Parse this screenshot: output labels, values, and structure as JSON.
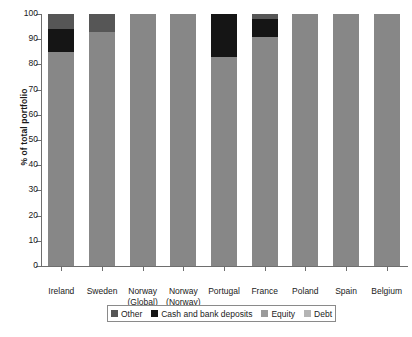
{
  "chart_data": {
    "type": "bar",
    "stacked": true,
    "title": "",
    "xlabel": "",
    "ylabel": "% of total portfolio",
    "ylim": [
      0,
      100
    ],
    "ytick_labels": [
      "0",
      "10",
      "20",
      "30",
      "40",
      "50",
      "60",
      "70",
      "80",
      "90",
      "100"
    ],
    "ytick_values": [
      0,
      10,
      20,
      30,
      40,
      50,
      60,
      70,
      80,
      90,
      100
    ],
    "grid": false,
    "legend_position": "bottom",
    "categories": [
      "Ireland",
      "Sweden",
      "Norway (Global)",
      "Norway (Norway)",
      "Portugal",
      "France",
      "Poland",
      "Spain",
      "Belgium"
    ],
    "category_lines": [
      [
        "Ireland"
      ],
      [
        "Sweden"
      ],
      [
        "Norway",
        "(Global)"
      ],
      [
        "Norway",
        "(Norway)"
      ],
      [
        "Portugal"
      ],
      [
        "France"
      ],
      [
        "Poland"
      ],
      [
        "Spain"
      ],
      [
        "Belgium"
      ]
    ],
    "series": [
      {
        "name": "Other",
        "color": "#565656",
        "values": [
          6,
          7,
          0,
          0,
          0,
          2,
          0,
          0,
          0
        ]
      },
      {
        "name": "Cash and bank deposits",
        "color": "#151515",
        "values": [
          9,
          0,
          0,
          0,
          17,
          7,
          0,
          0,
          0
        ]
      },
      {
        "name": "Equity",
        "color": "#878787",
        "values": [
          85,
          93,
          100,
          100,
          83,
          91,
          100,
          100,
          100
        ]
      },
      {
        "name": "Debt",
        "color": "#a8a8a8",
        "values": [
          0,
          0,
          0,
          0,
          0,
          0,
          0,
          0,
          0
        ]
      }
    ],
    "legend_entries": [
      {
        "label": "Other",
        "color": "#565656"
      },
      {
        "label": "Cash and bank deposits",
        "color": "#151515"
      },
      {
        "label": "Equity",
        "color": "#9a9a9a"
      },
      {
        "label": "Debt",
        "color": "#b4b4b4"
      }
    ]
  }
}
